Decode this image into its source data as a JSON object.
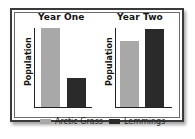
{
  "chart_data": [
    {
      "type": "bar",
      "title": "Year One",
      "ylabel": "Population",
      "xlabel": "",
      "categories": [
        "Arctic Grass",
        "Lemmings"
      ],
      "values": [
        100,
        37
      ],
      "ylim": [
        0,
        100
      ],
      "grid": false,
      "tick_labels_shown": false,
      "colors": [
        "#a8a8a8",
        "#2a2a2a"
      ]
    },
    {
      "type": "bar",
      "title": "Year Two",
      "ylabel": "Population",
      "xlabel": "",
      "categories": [
        "Arctic Grass",
        "Lemmings"
      ],
      "values": [
        84,
        99
      ],
      "ylim": [
        0,
        100
      ],
      "grid": false,
      "tick_labels_shown": false,
      "colors": [
        "#a8a8a8",
        "#2a2a2a"
      ]
    }
  ],
  "legend": {
    "position": "bottom",
    "items": [
      {
        "label": "Arctic Grass",
        "color": "#a8a8a8"
      },
      {
        "label": "Lemmings",
        "color": "#2a2a2a"
      }
    ]
  },
  "panels": [
    {
      "title": "Year One",
      "ylabel": "Population"
    },
    {
      "title": "Year Two",
      "ylabel": "Population"
    }
  ]
}
